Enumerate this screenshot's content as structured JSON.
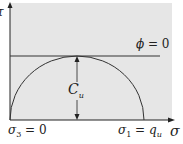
{
  "diagram": {
    "axes": {
      "x_label": "σ",
      "y_label": "τ"
    },
    "envelope_label": "ϕ = 0",
    "radius_label": "C",
    "radius_label_sub": "u",
    "left_point_label": "σ",
    "left_point_sub": "3",
    "left_point_value": " = 0",
    "right_point_label": "σ",
    "right_point_sub": "1",
    "right_point_eq": " = q",
    "right_point_value_sub": "u",
    "colors": {
      "plot_background": "#e6e6e6",
      "line": "#222222",
      "page": "#ffffff"
    }
  }
}
